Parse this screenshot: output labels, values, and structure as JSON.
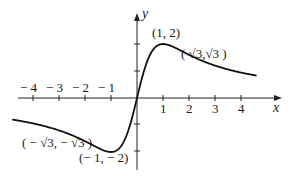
{
  "chart_data": {
    "type": "line",
    "title": "",
    "function": "y = 4x/(x^2+1)",
    "xlabel": "x",
    "ylabel": "y",
    "xlim": [
      -4.8,
      4.6
    ],
    "ylim": [
      -2.7,
      3.1
    ],
    "grid": false,
    "x_tick_labels": [
      "− 4",
      "− 3",
      "− 2",
      "− 1",
      "1",
      "2",
      "3",
      "4"
    ],
    "x_ticks": [
      -4,
      -3,
      -2,
      -1,
      1,
      2,
      3,
      4
    ],
    "y_ticks": [
      -2,
      -1,
      1,
      2
    ],
    "series": [
      {
        "name": "f(x)",
        "x": [
          -4.8,
          -4,
          -3,
          -2,
          -1.732,
          -1,
          -0.5,
          0,
          0.5,
          1,
          1.732,
          2,
          3,
          4,
          4.6
        ],
        "y": [
          -0.8,
          -0.94,
          -1.2,
          -1.6,
          -1.732,
          -2,
          -1.6,
          0,
          1.6,
          2,
          1.732,
          1.6,
          1.2,
          0.94,
          0.83
        ]
      }
    ],
    "annotations": [
      {
        "text": "(1, 2)",
        "x": 1,
        "y": 2
      },
      {
        "text": "( √3,√3 )",
        "x": 1.732,
        "y": 1.732
      },
      {
        "text": "( − √3, − √3 )",
        "x": -1.732,
        "y": -1.732
      },
      {
        "text": "(− 1, − 2)",
        "x": -1,
        "y": -2
      }
    ]
  },
  "labels": {
    "x_axis": "x",
    "y_axis": "y",
    "xm4": "− 4",
    "xm3": "− 3",
    "xm2": "− 2",
    "xm1": "− 1",
    "x1": "1",
    "x2": "2",
    "x3": "3",
    "x4": "4",
    "max_point": "(1, 2)",
    "inflect_pos": "( √3,√3 )",
    "inflect_neg": "( − √3, − √3 )",
    "min_point": "(− 1, − 2)"
  }
}
